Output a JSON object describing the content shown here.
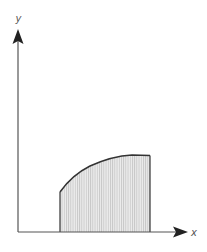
{
  "diagram": {
    "title": "",
    "axes": {
      "x_label": "x",
      "y_label": "y"
    },
    "shaded_region": {
      "description": "area under curve between two vertical bounds",
      "fill_pattern": "vertical-hatch"
    },
    "colors": {
      "axis": "#333333",
      "curve": "#333333",
      "fill": "#e4e4e4",
      "hatch": "#b8b8b8",
      "label": "#555555"
    }
  }
}
